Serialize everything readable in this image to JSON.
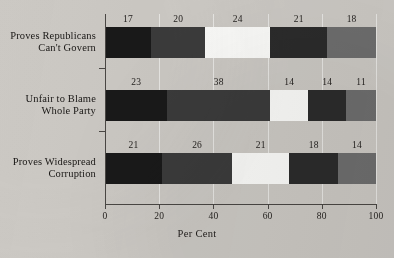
{
  "chart_data": {
    "type": "bar",
    "orientation": "horizontal",
    "stacked": true,
    "title": "",
    "xlabel": "Per Cent",
    "ylabel": "",
    "xlim": [
      0,
      100
    ],
    "xticks": [
      0,
      20,
      40,
      60,
      80,
      100
    ],
    "xtick_labels": [
      "0",
      "20",
      "40",
      "60",
      "80",
      "100"
    ],
    "grid": true,
    "legend": "none",
    "categories": [
      {
        "line1": "Proves Republicans",
        "line2": "Can't Govern",
        "values": [
          17,
          20,
          24,
          21,
          18
        ]
      },
      {
        "line1": "Unfair to Blame",
        "line2": "Whole Party",
        "values": [
          23,
          38,
          14,
          14,
          11
        ]
      },
      {
        "line1": "Proves Widespread",
        "line2": "Corruption",
        "values": [
          21,
          26,
          21,
          18,
          14
        ]
      }
    ],
    "series_colors": [
      "#191919",
      "#3b3b3b",
      "#fbfbf9",
      "#2b2b2b",
      "#6e6e6e"
    ],
    "background_color": "#ccc9c4"
  }
}
